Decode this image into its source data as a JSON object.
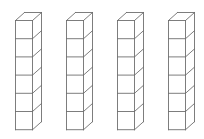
{
  "diagram": {
    "type": "cube-towers",
    "tower_count": 4,
    "cubes_per_tower": 6,
    "line_color": "#6e6e6e",
    "background": "#ffffff",
    "towers": [
      {
        "label": "",
        "x": 15,
        "cubes": 6
      },
      {
        "label": "",
        "x": 66,
        "cubes": 6
      },
      {
        "label": "",
        "x": 117,
        "cubes": 6
      },
      {
        "label": "",
        "x": 168,
        "cubes": 6
      }
    ],
    "geometry": {
      "top_y": 20,
      "cube_width": 17,
      "cube_height": 18.2,
      "depth_dx": 9,
      "depth_dy": 8
    }
  }
}
